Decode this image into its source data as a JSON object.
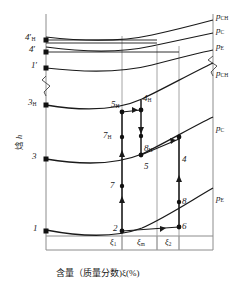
{
  "figure": {
    "type": "enthalpy-concentration-diagram",
    "axes": {
      "y_label": "焓 h",
      "y_label_cn": "焓",
      "y_label_sym": "h",
      "x_label": "含量（质量分数)ξ(%)",
      "x_ticks": [
        {
          "id": "xi1",
          "label": "ξ",
          "sub": "1"
        },
        {
          "id": "xim",
          "label": "ξ",
          "sub": "m"
        },
        {
          "id": "xi2",
          "label": "ξ",
          "sub": "2"
        }
      ],
      "axis_break": "≈"
    },
    "isobars_top": [
      {
        "id": "p-ch-top",
        "sym": "p",
        "sub": "CH"
      },
      {
        "id": "p-c-top",
        "sym": "p",
        "sub": "C"
      },
      {
        "id": "p-e-top",
        "sym": "p",
        "sub": "E"
      }
    ],
    "isobars_bottom": [
      {
        "id": "p-ch-bot",
        "sym": "p",
        "sub": "CH"
      },
      {
        "id": "p-c-bot",
        "sym": "p",
        "sub": "C"
      },
      {
        "id": "p-e-bot",
        "sym": "p",
        "sub": "E"
      }
    ],
    "left_axis_points": [
      {
        "id": "pt-4hp",
        "num": "4",
        "prime": "′",
        "sub": "H"
      },
      {
        "id": "pt-4p",
        "num": "4",
        "prime": "′",
        "sub": ""
      },
      {
        "id": "pt-1p",
        "num": "1",
        "prime": "′",
        "sub": ""
      },
      {
        "id": "pt-3h",
        "num": "3",
        "prime": "",
        "sub": "H"
      },
      {
        "id": "pt-3",
        "num": "3",
        "prime": "",
        "sub": ""
      },
      {
        "id": "pt-1",
        "num": "1",
        "prime": "",
        "sub": ""
      }
    ],
    "interior_points": [
      {
        "id": "pt-5h",
        "num": "5",
        "sub": "H"
      },
      {
        "id": "pt-4h",
        "num": "4",
        "sub": "H"
      },
      {
        "id": "pt-7h",
        "num": "7",
        "sub": "H"
      },
      {
        "id": "pt-8h",
        "num": "8",
        "sub": "H"
      },
      {
        "id": "pt-5",
        "num": "5",
        "sub": ""
      },
      {
        "id": "pt-4",
        "num": "4",
        "sub": ""
      },
      {
        "id": "pt-7",
        "num": "7",
        "sub": ""
      },
      {
        "id": "pt-8",
        "num": "8",
        "sub": ""
      },
      {
        "id": "pt-2",
        "num": "2",
        "sub": ""
      },
      {
        "id": "pt-6",
        "num": "6",
        "sub": ""
      }
    ],
    "colors": {
      "curve": "#1a1a1a",
      "grid": "#8c8c8c",
      "text": "#1a1a1a",
      "background": "#ffffff"
    }
  }
}
